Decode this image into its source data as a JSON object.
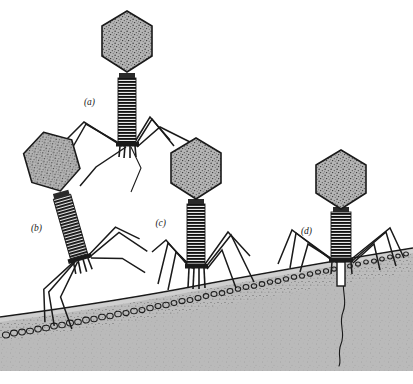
{
  "figure": {
    "background_color": "#ffffff",
    "canvas": {
      "width": 413,
      "height": 384
    }
  },
  "labels": {
    "a": "(a)",
    "b": "(b)",
    "c": "(c)",
    "d": "(d)"
  },
  "palette": {
    "ink": "#1a1a1a",
    "head_fill": "#b4b4b4",
    "head_stipple": "#3a3a3a",
    "cytoplasm": "#b9b9b9",
    "wall_band": "#cfcfcf",
    "wall_bead": "#2a2a2a",
    "background": "#ffffff"
  },
  "phages": [
    {
      "id": "a",
      "label": "(a)",
      "stage": "free-floating above cell surface",
      "head_shape": "elongated hexagon, stippled gray",
      "tail": "extended striated sheath",
      "legs": "six long jointed tail fibers extended outward",
      "contact": "none",
      "dna_injected": false,
      "label_position": {
        "x": 95,
        "y": 105
      }
    },
    {
      "id": "b",
      "label": "(b)",
      "stage": "approaching surface at an angle, tail fibers reaching down",
      "head_shape": "elongated hexagon, stippled gray",
      "tail": "extended striated sheath, tilted",
      "legs": "long jointed tail fibers splayed toward the cell wall",
      "contact": "tail fiber tips touching wall",
      "dna_injected": false,
      "label_position": {
        "x": 30,
        "y": 231
      }
    },
    {
      "id": "c",
      "label": "(c)",
      "stage": "landed on surface, base plate pins contacting cell wall",
      "head_shape": "elongated hexagon, stippled gray",
      "tail": "extended striated sheath, upright",
      "legs": "tail fibers bent, standing on the wall",
      "contact": "base plate pins on wall",
      "dna_injected": false,
      "label_position": {
        "x": 166,
        "y": 226
      }
    },
    {
      "id": "d",
      "label": "(d)",
      "stage": "sheath contracted, tail core penetrating wall, DNA injected",
      "head_shape": "elongated hexagon, stippled gray",
      "tail": "contracted striated sheath with core driven through the wall",
      "legs": "tail fibers flattened against the cell surface",
      "contact": "base plate flush on wall, core penetrating",
      "dna_injected": true,
      "label_position": {
        "x": 312,
        "y": 234
      }
    }
  ],
  "cell_surface": {
    "name": "bacterial cell envelope",
    "curvature": "convex arc rising to the right",
    "layers": [
      {
        "name": "outer-membrane-line",
        "description": "thin dark outline at the top of the envelope"
      },
      {
        "name": "wall-band",
        "description": "light gray band beneath the outer line"
      },
      {
        "name": "peptidoglycan-bead-row",
        "description": "row of small dark circles/ovals"
      },
      {
        "name": "cytoplasm",
        "description": "stippled mid-gray interior filling the lower area"
      }
    ]
  },
  "injected_dna": {
    "name": "phage DNA strand",
    "description": "thin wavy dark line descending from phage (d) into the cytoplasm",
    "source_phage": "d"
  }
}
